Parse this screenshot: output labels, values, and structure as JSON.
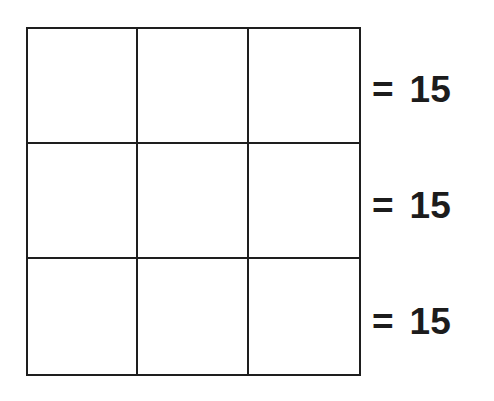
{
  "diagram": {
    "type": "magic-square-puzzle",
    "rows": 3,
    "cols": 3,
    "cells": [
      [
        "",
        "",
        ""
      ],
      [
        "",
        "",
        ""
      ],
      [
        "",
        "",
        ""
      ]
    ],
    "line_color": "#1e1e1e",
    "row_sums": [
      {
        "equals": "=",
        "value": "15"
      },
      {
        "equals": "=",
        "value": "15"
      },
      {
        "equals": "=",
        "value": "15"
      }
    ]
  }
}
